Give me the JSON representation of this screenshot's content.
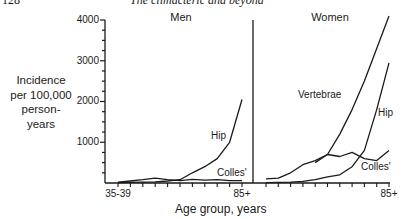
{
  "page_header": {
    "page_number": "128",
    "running_title": "The climacteric and beyond"
  },
  "chart_data": {
    "type": "line",
    "title": "",
    "ylabel": "Incidence per 100,000 person-years",
    "ylabel_lines": [
      "Incidence",
      "per 100,000",
      "person-",
      "years"
    ],
    "xlabel": "Age group, years",
    "ylim": [
      0,
      4000
    ],
    "yticks": [
      1000,
      2000,
      3000,
      4000
    ],
    "ytick_labels": [
      "1000",
      "2000",
      "3000",
      "4000"
    ],
    "grid": false,
    "legend": "inline labels",
    "categories": [
      "35-39",
      "40-44",
      "45-49",
      "50-54",
      "55-59",
      "60-64",
      "65-69",
      "70-74",
      "75-79",
      "80-84",
      "85+"
    ],
    "panels": [
      {
        "title": "Men",
        "xtick_labels_shown": [
          "35-39",
          "85+"
        ],
        "series": [
          {
            "name": "Hip",
            "values": [
              10,
              15,
              20,
              30,
              50,
              80,
              250,
              400,
              600,
              1000,
              2050
            ]
          },
          {
            "name": "Colles'",
            "values": [
              20,
              50,
              80,
              120,
              80,
              60,
              90,
              70,
              80,
              60,
              60
            ]
          }
        ]
      },
      {
        "title": "Women",
        "xtick_labels_shown": [
          "85+"
        ],
        "series": [
          {
            "name": "Vertebrae",
            "values": [
              null,
              null,
              null,
              null,
              500,
              700,
              1200,
              1800,
              2500,
              3300,
              4100
            ]
          },
          {
            "name": "Hip",
            "values": [
              10,
              15,
              20,
              40,
              80,
              150,
              200,
              400,
              800,
              1800,
              2950
            ]
          },
          {
            "name": "Colles'",
            "values": [
              100,
              120,
              250,
              450,
              550,
              700,
              650,
              750,
              600,
              550,
              800
            ]
          }
        ]
      }
    ]
  },
  "labels": {
    "men_title": "Men",
    "women_title": "Women",
    "men_hip": "Hip",
    "men_colles": "Colles'",
    "women_vertebrae": "Vertebrae",
    "women_hip": "Hip",
    "women_colles": "Colles'",
    "x_first": "35-39",
    "x_men_last": "85+",
    "x_women_last": "85+",
    "y_4000": "4000",
    "y_3000": "3000",
    "y_2000": "2000",
    "y_1000": "1000"
  }
}
